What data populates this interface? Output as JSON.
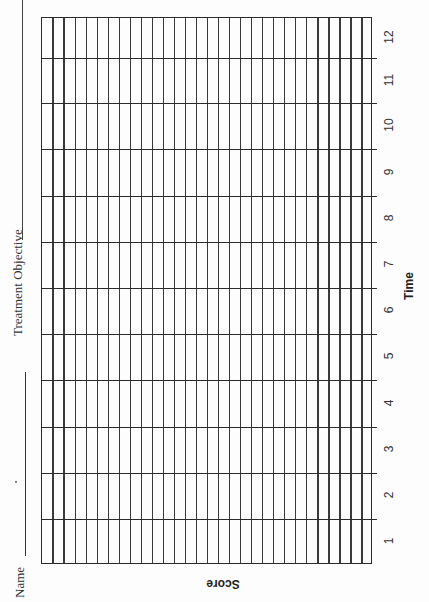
{
  "form": {
    "name_label": "Name",
    "name_value": "",
    "treatment_objective_label": "Treatment Objective",
    "treatment_objective_value": ""
  },
  "chart_data": {
    "type": "table",
    "title": "",
    "xlabel": "Time",
    "ylabel": "Score",
    "x_ticks": [
      "1",
      "2",
      "3",
      "4",
      "5",
      "6",
      "7",
      "8",
      "9",
      "10",
      "11",
      "12"
    ],
    "xlim": [
      1,
      12
    ],
    "score_subdivisions": 30,
    "grid": true,
    "orientation": "rotated 90° counter-clockwise (landscape form printed on portrait page)",
    "series": []
  },
  "axis": {
    "time_label": "Time",
    "score_label": "Score",
    "ticks": [
      {
        "label": "12"
      },
      {
        "label": "11"
      },
      {
        "label": "10"
      },
      {
        "label": "9"
      },
      {
        "label": "8"
      },
      {
        "label": "7"
      },
      {
        "label": "6"
      },
      {
        "label": "5"
      },
      {
        "label": "4"
      },
      {
        "label": "3"
      },
      {
        "label": "2"
      },
      {
        "label": "1"
      }
    ]
  }
}
